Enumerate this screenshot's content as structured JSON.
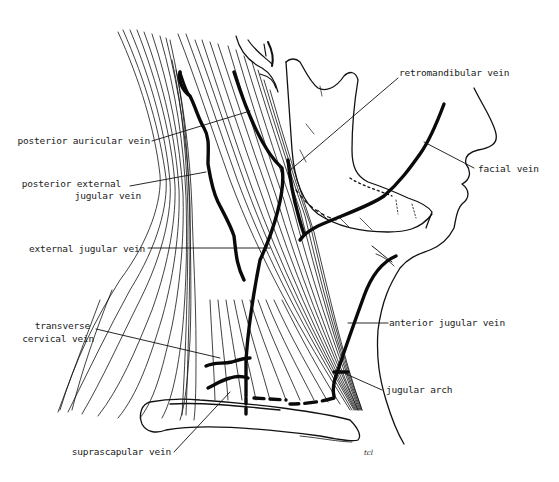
{
  "diagram": {
    "labels": {
      "posterior_auricular_vein": "posterior auricular vein",
      "posterior_external_jugular_vein_line1": "posterior external",
      "posterior_external_jugular_vein_line2": "jugular vein",
      "external_jugular_vein": "external jugular vein",
      "transverse_cervical_vein_line1": "transverse",
      "transverse_cervical_vein_line2": "cervical vein",
      "suprascapular_vein": "suprascapular vein",
      "retromandibular_vein": "retromandibular vein",
      "facial_vein": "facial vein",
      "anterior_jugular_vein": "anterior jugular vein",
      "jugular_arch": "jugular arch"
    },
    "signature": "tcl",
    "colors": {
      "background": "#ffffff",
      "ink": "#111111"
    }
  }
}
